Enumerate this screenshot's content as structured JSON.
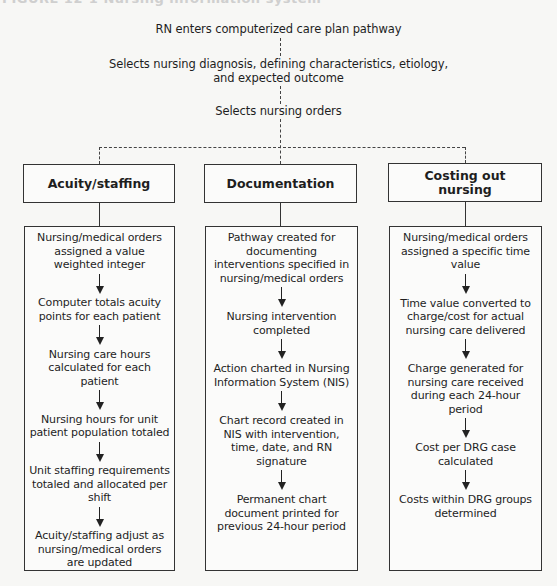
{
  "caption": "FIGURE 12-1 Nursing information system",
  "flow": {
    "step1": "RN enters computerized care plan pathway",
    "step2_line1": "Selects nursing diagnosis, defining characteristics, etiology,",
    "step2_line2": "and expected outcome",
    "step3": "Selects nursing orders"
  },
  "columns": [
    {
      "title": "Acuity/staffing",
      "items": [
        "Nursing/medical orders assigned a value weighted integer",
        "Computer totals acuity points for each patient",
        "Nursing care hours calculated for each patient",
        "Nursing hours for unit patient population totaled",
        "Unit staffing requirements totaled and allocated per shift",
        "Acuity/staffing adjust as nursing/medical orders are updated"
      ]
    },
    {
      "title": "Documentation",
      "items": [
        "Pathway created for documenting interventions specified in nursing/medical orders",
        "Nursing intervention completed",
        "Action charted in Nursing Information System (NIS)",
        "Chart record created in NIS with intervention, time, date, and RN signature",
        "Permanent chart document printed for previous 24-hour period"
      ]
    },
    {
      "title": "Costing out nursing",
      "items": [
        "Nursing/medical orders assigned a specific time value",
        "Time value converted to charge/cost for actual nursing care delivered",
        "Charge generated for nursing care received during each 24-hour period",
        "Cost per DRG case calculated",
        "Costs within DRG groups determined"
      ]
    }
  ]
}
